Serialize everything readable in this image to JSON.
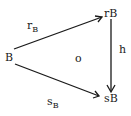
{
  "diagram": {
    "type": "commutative-triangle",
    "nodes": {
      "source": {
        "label": "B"
      },
      "top_right": {
        "label": "rB"
      },
      "bottom_right": {
        "label": "sB"
      }
    },
    "arrows": {
      "top": {
        "name": "r",
        "subscript": "B",
        "from": "B",
        "to": "rB"
      },
      "bottom": {
        "name": "s",
        "subscript": "B",
        "from": "B",
        "to": "sB"
      },
      "vertical": {
        "name": "h",
        "from": "rB",
        "to": "sB"
      }
    },
    "center_mark": "o",
    "colors": {
      "ink": "#1a1a1a",
      "background": "#ffffff"
    }
  }
}
